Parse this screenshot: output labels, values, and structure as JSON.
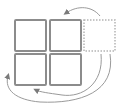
{
  "diagram": {
    "colors": {
      "cell_border": "#8c8c8c",
      "dashed_border": "#b4b4b4",
      "arrow": "#9a9a9a",
      "background": "#ffffff"
    },
    "cells": [
      {
        "id": "top-left",
        "style": "solid"
      },
      {
        "id": "top-right",
        "style": "solid"
      },
      {
        "id": "bottom-left",
        "style": "solid"
      },
      {
        "id": "bottom-right",
        "style": "solid"
      },
      {
        "id": "ghost-right",
        "style": "dashed"
      }
    ],
    "arrows": [
      {
        "from": "ghost-right",
        "to": "top-right",
        "shape": "arc-over-top"
      },
      {
        "from": "ghost-right",
        "to": "bottom-left",
        "shape": "arc-under-bottom"
      },
      {
        "from": "right-side",
        "to": "bottom-right",
        "shape": "arc-under-bottom"
      }
    ]
  }
}
